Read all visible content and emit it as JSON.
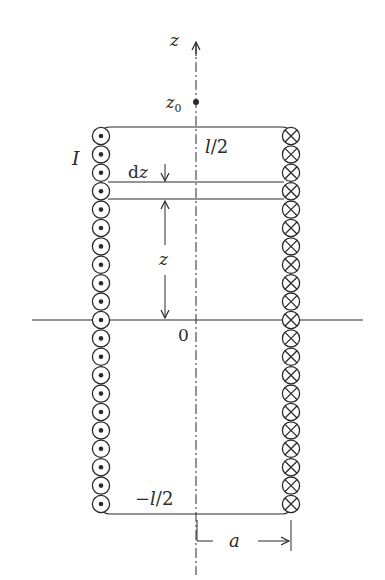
{
  "figure": {
    "type": "solenoid cross-section diagram",
    "labels": {
      "axis": "z",
      "point": "z",
      "point_sub": "0",
      "top": "l/2",
      "bottom": "−l/2",
      "origin": "0",
      "current": "I",
      "element": "dz",
      "distance": "z",
      "radius": "a"
    },
    "left_column": {
      "symbol": "dot-in-circle",
      "meaning": "current out of page",
      "count": 21
    },
    "right_column": {
      "symbol": "cross-in-circle",
      "meaning": "current into page",
      "count": 21
    },
    "colors": {
      "ink": "#2a2a2a",
      "background": "#ffffff"
    }
  }
}
